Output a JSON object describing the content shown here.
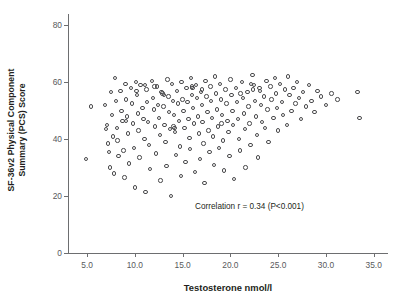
{
  "chart_data": {
    "type": "scatter",
    "title": "",
    "xlabel": "Testosterone nmol/l",
    "ylabel_line1": "SF-36v2 Physical Component",
    "ylabel_line2": "Summary (PCS) Score",
    "xlim": [
      3.0,
      36.5
    ],
    "ylim": [
      0,
      84
    ],
    "xticks": [
      5.0,
      10.0,
      15.0,
      20.0,
      25.0,
      30.0,
      35.0
    ],
    "xticklabels": [
      "5.0",
      "10.0",
      "15.0",
      "20.0",
      "25.0",
      "30.0",
      "35.0"
    ],
    "yticks": [
      0,
      20,
      40,
      60,
      80
    ],
    "yticklabels": [
      "0",
      "20",
      "40",
      "60",
      "80"
    ],
    "grid": false,
    "legend": null,
    "annotations": [
      {
        "text": "Correlation r = 0.34 (P<0.001)",
        "x": 22.0,
        "y": 16.5
      }
    ],
    "marker": {
      "style": "open-circle",
      "size_px": 4.4,
      "edge_color": "#4a4a4c",
      "face_color": "none"
    },
    "statistics": {
      "correlation_r": 0.34,
      "p_value": "<0.001",
      "n_points": 203
    },
    "points": [
      [
        4.9,
        33.0
      ],
      [
        5.4,
        51.5
      ],
      [
        6.9,
        52.0
      ],
      [
        7.0,
        43.5
      ],
      [
        7.1,
        45.0
      ],
      [
        7.2,
        38.5
      ],
      [
        7.3,
        35.5
      ],
      [
        7.4,
        30.0
      ],
      [
        7.5,
        56.5
      ],
      [
        7.6,
        48.5
      ],
      [
        7.7,
        41.0
      ],
      [
        7.8,
        28.0
      ],
      [
        7.9,
        61.5
      ],
      [
        8.0,
        53.5
      ],
      [
        8.1,
        44.0
      ],
      [
        8.2,
        39.5
      ],
      [
        8.3,
        34.0
      ],
      [
        8.5,
        57.0
      ],
      [
        8.6,
        50.0
      ],
      [
        8.7,
        46.5
      ],
      [
        8.8,
        36.0
      ],
      [
        8.9,
        26.5
      ],
      [
        9.0,
        59.5
      ],
      [
        9.1,
        54.0
      ],
      [
        9.2,
        48.0
      ],
      [
        9.3,
        42.0
      ],
      [
        9.4,
        31.5
      ],
      [
        9.6,
        58.0
      ],
      [
        9.7,
        52.5
      ],
      [
        9.8,
        45.5
      ],
      [
        9.9,
        37.0
      ],
      [
        10.0,
        23.0
      ],
      [
        10.1,
        60.0
      ],
      [
        10.2,
        55.5
      ],
      [
        10.3,
        49.0
      ],
      [
        10.4,
        43.0
      ],
      [
        10.5,
        33.5
      ],
      [
        10.6,
        59.0
      ],
      [
        10.8,
        51.0
      ],
      [
        10.9,
        47.0
      ],
      [
        11.0,
        40.0
      ],
      [
        11.1,
        21.5
      ],
      [
        11.2,
        57.5
      ],
      [
        11.3,
        53.0
      ],
      [
        11.4,
        46.0
      ],
      [
        11.5,
        38.0
      ],
      [
        11.6,
        29.5
      ],
      [
        11.8,
        60.5
      ],
      [
        11.9,
        54.5
      ],
      [
        12.0,
        50.5
      ],
      [
        12.1,
        44.5
      ],
      [
        12.2,
        35.0
      ],
      [
        12.3,
        58.5
      ],
      [
        12.4,
        52.0
      ],
      [
        12.5,
        47.5
      ],
      [
        12.6,
        41.5
      ],
      [
        12.7,
        25.5
      ],
      [
        12.9,
        56.0
      ],
      [
        13.0,
        51.5
      ],
      [
        13.1,
        45.0
      ],
      [
        13.2,
        39.0
      ],
      [
        13.3,
        30.5
      ],
      [
        13.4,
        61.0
      ],
      [
        13.5,
        55.0
      ],
      [
        13.6,
        49.5
      ],
      [
        13.7,
        43.5
      ],
      [
        13.8,
        20.0
      ],
      [
        13.9,
        59.5
      ],
      [
        14.0,
        53.5
      ],
      [
        14.1,
        48.5
      ],
      [
        14.2,
        42.5
      ],
      [
        14.3,
        34.5
      ],
      [
        14.4,
        57.0
      ],
      [
        14.5,
        52.5
      ],
      [
        14.6,
        46.5
      ],
      [
        14.7,
        37.5
      ],
      [
        14.8,
        27.0
      ],
      [
        14.9,
        60.0
      ],
      [
        15.0,
        54.0
      ],
      [
        15.1,
        50.0
      ],
      [
        15.2,
        44.0
      ],
      [
        15.3,
        32.0
      ],
      [
        15.4,
        58.0
      ],
      [
        15.5,
        53.0
      ],
      [
        15.6,
        47.0
      ],
      [
        15.7,
        40.5
      ],
      [
        15.8,
        36.5
      ],
      [
        15.9,
        61.5
      ],
      [
        16.0,
        55.5
      ],
      [
        16.1,
        51.0
      ],
      [
        16.2,
        45.5
      ],
      [
        16.3,
        28.5
      ],
      [
        16.4,
        59.0
      ],
      [
        16.5,
        54.5
      ],
      [
        16.6,
        48.0
      ],
      [
        16.7,
        42.0
      ],
      [
        16.8,
        33.0
      ],
      [
        16.9,
        56.5
      ],
      [
        17.0,
        52.0
      ],
      [
        17.1,
        46.0
      ],
      [
        17.2,
        38.5
      ],
      [
        17.3,
        24.5
      ],
      [
        17.4,
        60.5
      ],
      [
        17.5,
        55.0
      ],
      [
        17.6,
        49.5
      ],
      [
        17.7,
        43.0
      ],
      [
        17.8,
        35.5
      ],
      [
        17.9,
        58.5
      ],
      [
        18.0,
        53.5
      ],
      [
        18.1,
        47.5
      ],
      [
        18.2,
        41.0
      ],
      [
        18.3,
        31.0
      ],
      [
        18.4,
        62.0
      ],
      [
        18.5,
        56.0
      ],
      [
        18.6,
        50.5
      ],
      [
        18.7,
        44.5
      ],
      [
        18.8,
        37.0
      ],
      [
        18.9,
        59.5
      ],
      [
        19.0,
        54.0
      ],
      [
        19.1,
        48.5
      ],
      [
        19.2,
        39.5
      ],
      [
        19.3,
        29.0
      ],
      [
        19.5,
        57.5
      ],
      [
        19.6,
        52.5
      ],
      [
        19.7,
        46.5
      ],
      [
        19.8,
        42.5
      ],
      [
        19.9,
        34.0
      ],
      [
        20.0,
        61.0
      ],
      [
        20.1,
        55.5
      ],
      [
        20.2,
        50.0
      ],
      [
        20.3,
        45.0
      ],
      [
        20.4,
        26.0
      ],
      [
        20.6,
        58.0
      ],
      [
        20.7,
        53.0
      ],
      [
        20.8,
        47.0
      ],
      [
        20.9,
        40.0
      ],
      [
        21.0,
        36.0
      ],
      [
        21.2,
        60.0
      ],
      [
        21.3,
        54.5
      ],
      [
        21.4,
        49.0
      ],
      [
        21.5,
        43.5
      ],
      [
        21.6,
        30.0
      ],
      [
        21.8,
        56.5
      ],
      [
        21.9,
        51.5
      ],
      [
        22.0,
        45.5
      ],
      [
        22.1,
        38.0
      ],
      [
        22.3,
        62.5
      ],
      [
        22.5,
        59.0
      ],
      [
        22.6,
        53.5
      ],
      [
        22.7,
        48.0
      ],
      [
        22.8,
        41.5
      ],
      [
        22.9,
        33.5
      ],
      [
        23.1,
        57.0
      ],
      [
        23.2,
        52.0
      ],
      [
        23.3,
        46.0
      ],
      [
        23.5,
        55.0
      ],
      [
        23.6,
        44.0
      ],
      [
        23.8,
        60.5
      ],
      [
        23.9,
        50.5
      ],
      [
        24.0,
        39.0
      ],
      [
        24.2,
        58.5
      ],
      [
        24.3,
        54.0
      ],
      [
        24.5,
        47.5
      ],
      [
        24.7,
        61.5
      ],
      [
        24.8,
        56.0
      ],
      [
        24.9,
        51.0
      ],
      [
        25.0,
        43.0
      ],
      [
        25.2,
        59.5
      ],
      [
        25.4,
        53.0
      ],
      [
        25.5,
        48.5
      ],
      [
        25.7,
        57.5
      ],
      [
        25.9,
        45.0
      ],
      [
        26.0,
        62.0
      ],
      [
        26.2,
        55.5
      ],
      [
        26.4,
        50.0
      ],
      [
        26.6,
        58.0
      ],
      [
        26.8,
        52.5
      ],
      [
        27.0,
        60.0
      ],
      [
        27.2,
        54.5
      ],
      [
        27.4,
        47.0
      ],
      [
        27.6,
        56.5
      ],
      [
        27.9,
        51.5
      ],
      [
        28.2,
        59.0
      ],
      [
        28.5,
        53.5
      ],
      [
        28.8,
        49.5
      ],
      [
        29.1,
        57.0
      ],
      [
        29.5,
        55.0
      ],
      [
        30.0,
        52.0
      ],
      [
        30.6,
        56.0
      ],
      [
        31.2,
        54.0
      ],
      [
        33.3,
        56.5
      ],
      [
        33.5,
        47.5
      ],
      [
        12.8,
        56.5
      ],
      [
        13.05,
        55.5
      ],
      [
        14.05,
        44.5
      ],
      [
        14.15,
        44.0
      ],
      [
        15.95,
        58.5
      ],
      [
        16.05,
        58.0
      ],
      [
        19.05,
        45.5
      ],
      [
        21.05,
        56.0
      ],
      [
        22.15,
        59.5
      ],
      [
        22.35,
        57.5
      ],
      [
        23.05,
        58.0
      ],
      [
        9.05,
        46.5
      ],
      [
        10.15,
        57.0
      ],
      [
        11.05,
        59.0
      ],
      [
        12.05,
        58.5
      ],
      [
        17.05,
        57.5
      ]
    ]
  }
}
